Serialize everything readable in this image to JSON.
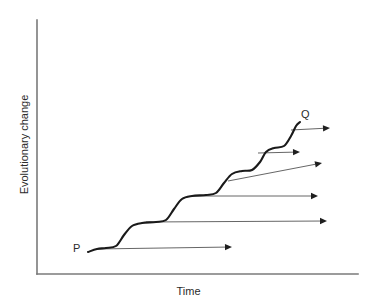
{
  "figure": {
    "type": "line-diagram",
    "width": 377,
    "height": 306,
    "background_color": "#ffffff"
  },
  "axes": {
    "x_label": "Time",
    "y_label": "Evolutionary change",
    "x_axis": {
      "x1": 37,
      "y1": 274,
      "x2": 358,
      "y2": 274
    },
    "y_axis": {
      "x1": 37,
      "y1": 20,
      "x2": 37,
      "y2": 274
    },
    "color": "#7a7a7a",
    "ticks": [],
    "grid": false
  },
  "labels": {
    "start_point": "P",
    "end_point": "Q"
  },
  "chart_data": {
    "type": "line",
    "title": "",
    "xlabel": "Time",
    "ylabel": "Evolutionary change",
    "grid": false,
    "series": [
      {
        "name": "punctuated-equilibrium-lineage",
        "description": "Stepwise staircase curve from P to Q: long stasis plateaus separated by rapid rises",
        "color": "#1a1a1a",
        "points": [
          [
            88,
            252
          ],
          [
            97,
            249
          ],
          [
            106,
            248
          ],
          [
            116,
            246
          ],
          [
            124,
            235
          ],
          [
            132,
            226
          ],
          [
            142,
            223
          ],
          [
            156,
            222
          ],
          [
            166,
            220
          ],
          [
            174,
            209
          ],
          [
            182,
            199
          ],
          [
            192,
            196
          ],
          [
            206,
            195
          ],
          [
            216,
            193
          ],
          [
            224,
            183
          ],
          [
            232,
            174
          ],
          [
            242,
            171
          ],
          [
            252,
            170
          ],
          [
            260,
            162
          ],
          [
            266,
            152
          ],
          [
            274,
            148
          ],
          [
            284,
            146
          ],
          [
            291,
            136
          ],
          [
            296,
            126
          ],
          [
            300,
            122
          ]
        ]
      }
    ],
    "annotations": [
      {
        "text": "P",
        "x": 78,
        "y": 250,
        "role": "lineage-origin"
      },
      {
        "text": "Q",
        "x": 306,
        "y": 116,
        "role": "lineage-terminus"
      }
    ],
    "branches": [
      {
        "name": "branch-1",
        "x1": 96,
        "y1": 249,
        "x2": 232,
        "y2": 247,
        "style": "horizontal"
      },
      {
        "name": "branch-2",
        "x1": 146,
        "y1": 222,
        "x2": 327,
        "y2": 221,
        "style": "horizontal"
      },
      {
        "name": "branch-3",
        "x1": 192,
        "y1": 196,
        "x2": 318,
        "y2": 196,
        "style": "horizontal"
      },
      {
        "name": "branch-4",
        "x1": 228,
        "y1": 181,
        "x2": 322,
        "y2": 163,
        "style": "sloped"
      },
      {
        "name": "branch-5",
        "x1": 258,
        "y1": 153,
        "x2": 300,
        "y2": 152,
        "style": "horizontal"
      },
      {
        "name": "branch-6",
        "x1": 291,
        "y1": 130,
        "x2": 330,
        "y2": 128,
        "style": "horizontal"
      }
    ],
    "branch_color": "#555555",
    "xlim": [
      37,
      358
    ],
    "ylim": [
      274,
      20
    ]
  }
}
